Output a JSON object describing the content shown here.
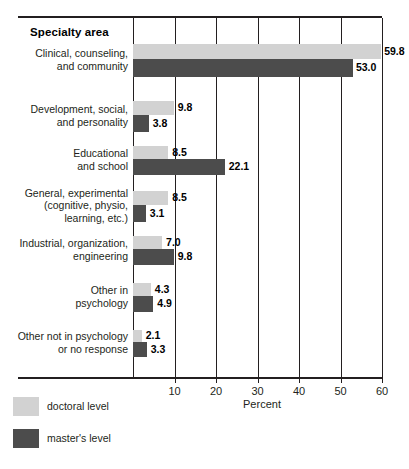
{
  "header": {
    "column_title": "Specialty area"
  },
  "chart_data": {
    "type": "bar",
    "orientation": "horizontal",
    "title": "",
    "xlabel": "Percent",
    "ylabel": "Specialty area",
    "xlim": [
      0,
      60
    ],
    "xticks": [
      10,
      20,
      30,
      40,
      50,
      60
    ],
    "grid": true,
    "legend_position": "bottom-left",
    "categories": [
      "Clinical, counseling,\nand community",
      "Development, social,\nand personality",
      "Educational\nand school",
      "General, experimental\n(cognitive, physio,\nlearning, etc.)",
      "Industrial, organization,\nengineering",
      "Other in\npsychology",
      "Other not in psychology\nor no response"
    ],
    "series": [
      {
        "name": "doctoral level",
        "color": "#d2d2d2",
        "values": [
          59.8,
          9.8,
          8.5,
          8.5,
          7.0,
          4.3,
          2.1
        ],
        "labels": [
          "59.8",
          "9.8",
          "8.5",
          "8.5",
          "7.0",
          "4.3",
          "2.1"
        ]
      },
      {
        "name": "master's level",
        "color": "#4c4c4c",
        "values": [
          53.0,
          3.8,
          22.1,
          3.1,
          9.8,
          4.9,
          3.3
        ],
        "labels": [
          "53.0",
          "3.8",
          "22.1",
          "3.1",
          "9.8",
          "4.9",
          "3.3"
        ]
      }
    ]
  },
  "categories_display": [
    {
      "line1": "Clinical, counseling,",
      "line2": "and community",
      "line3": ""
    },
    {
      "line1": "Development, social,",
      "line2": "and personality",
      "line3": ""
    },
    {
      "line1": "Educational",
      "line2": "and school",
      "line3": ""
    },
    {
      "line1": "General, experimental",
      "line2": "(cognitive, physio,",
      "line3": "learning, etc.)"
    },
    {
      "line1": "Industrial, organization,",
      "line2": "engineering",
      "line3": ""
    },
    {
      "line1": "Other in",
      "line2": "psychology",
      "line3": ""
    },
    {
      "line1": "Other not in psychology",
      "line2": "or no response",
      "line3": ""
    }
  ],
  "xticklabels": [
    "10",
    "20",
    "30",
    "40",
    "50",
    "60"
  ],
  "axis": {
    "xtitle": "Percent"
  },
  "legend": {
    "doctoral_label": "doctoral level",
    "masters_label": "master's level"
  },
  "colors": {
    "doctoral": "#d2d2d2",
    "masters": "#4c4c4c",
    "ink": "#231f20",
    "background": "#ffffff"
  }
}
